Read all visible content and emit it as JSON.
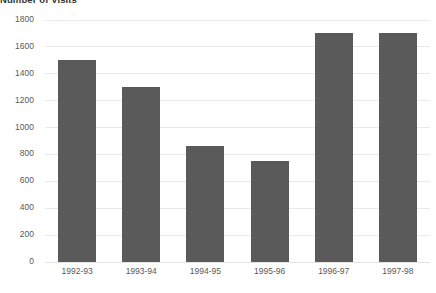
{
  "chart_data": {
    "type": "bar",
    "title": "Number of Visits",
    "xlabel": "",
    "ylabel": "",
    "categories": [
      "1992-93",
      "1993-94",
      "1994-95",
      "1995-96",
      "1996-97",
      "1997-98"
    ],
    "values": [
      1500,
      1300,
      860,
      750,
      1700,
      1700
    ],
    "series": [
      {
        "name": "Number of Visits",
        "values": [
          1500,
          1300,
          860,
          750,
          1700,
          1700
        ]
      }
    ],
    "ylim": [
      0,
      1800
    ],
    "yticks": [
      0,
      200,
      400,
      600,
      800,
      1000,
      1200,
      1400,
      1600,
      1800
    ],
    "ytick_labels": [
      "0",
      "200",
      "400",
      "600",
      "800",
      "1000",
      "1200",
      "1400",
      "1600",
      "1800"
    ],
    "grid": true,
    "legend": false,
    "legend_position": "none",
    "bar_color": "#5a5a5a",
    "gridline_color": "#e9e9e9",
    "background_color": "#ffffff",
    "text_color": "#595959",
    "title_color": "#333333"
  }
}
